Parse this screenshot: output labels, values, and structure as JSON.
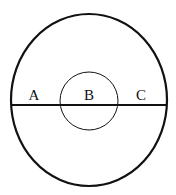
{
  "diagram": {
    "background": "#ffffff",
    "stroke_color": "#111111",
    "outer_circle": {
      "cx": 89,
      "cy": 100,
      "rx": 78,
      "ry": 86,
      "stroke_width": 2.2
    },
    "inner_circle": {
      "cx": 89,
      "cy": 101,
      "r": 29,
      "stroke_width": 1
    },
    "diameter_line": {
      "x1": 11,
      "y1": 105,
      "x2": 167,
      "y2": 105,
      "stroke_width": 2.2
    },
    "labels": [
      {
        "text": "A",
        "x": 34,
        "y": 100
      },
      {
        "text": "B",
        "x": 89,
        "y": 100
      },
      {
        "text": "C",
        "x": 141,
        "y": 100
      }
    ]
  }
}
